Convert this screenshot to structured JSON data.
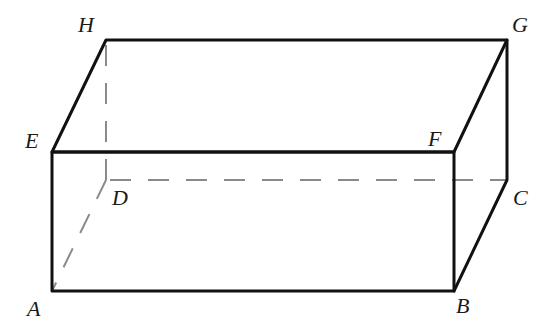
{
  "diagram": {
    "type": "rectangular-prism",
    "colors": {
      "edge": "#111111",
      "hidden_edge": "#8a8a8a",
      "label": "#1a1a1a",
      "background": "#ffffff"
    },
    "vertices": {
      "A": {
        "label": "A",
        "x": 52,
        "y": 291
      },
      "B": {
        "label": "B",
        "x": 454,
        "y": 291
      },
      "C": {
        "label": "C",
        "x": 507,
        "y": 180
      },
      "D": {
        "label": "D",
        "x": 106,
        "y": 180
      },
      "E": {
        "label": "E",
        "x": 52,
        "y": 152
      },
      "F": {
        "label": "F",
        "x": 454,
        "y": 152
      },
      "G": {
        "label": "G",
        "x": 507,
        "y": 40
      },
      "H": {
        "label": "H",
        "x": 106,
        "y": 40
      }
    },
    "visible_edges": [
      "AB",
      "BF",
      "FE",
      "EA",
      "EH",
      "HG",
      "GF",
      "GC",
      "CB"
    ],
    "hidden_edges": [
      "AD",
      "DC",
      "DH"
    ],
    "labels": [
      {
        "id": "H",
        "text": "H",
        "x": 78,
        "y": 32
      },
      {
        "id": "G",
        "text": "G",
        "x": 512,
        "y": 32
      },
      {
        "id": "E",
        "text": "E",
        "x": 25,
        "y": 148
      },
      {
        "id": "F",
        "text": "F",
        "x": 428,
        "y": 146
      },
      {
        "id": "D",
        "text": "D",
        "x": 112,
        "y": 205
      },
      {
        "id": "C",
        "text": "C",
        "x": 513,
        "y": 205
      },
      {
        "id": "A",
        "text": "A",
        "x": 27,
        "y": 316
      },
      {
        "id": "B",
        "text": "B",
        "x": 456,
        "y": 313
      }
    ]
  }
}
